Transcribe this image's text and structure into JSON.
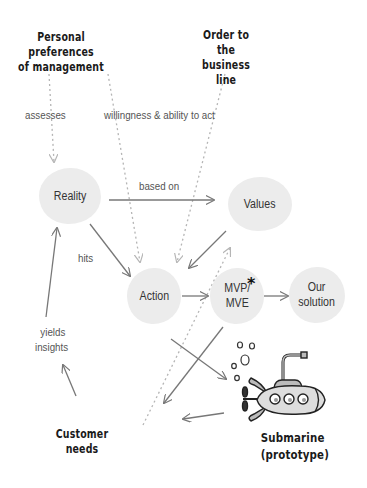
{
  "headings": {
    "top_left": [
      "Personal preferences",
      "of management"
    ],
    "top_right": [
      "Order to the",
      "business line"
    ],
    "bottom_left": "Customer needs",
    "bottom_right": [
      "Submarine",
      "(prototype)"
    ]
  },
  "nodes": {
    "reality": "Reality",
    "values": "Values",
    "action": "Action",
    "mvp": [
      "MVP/",
      "MVE"
    ],
    "mvp_marker": "*",
    "solution": [
      "Our",
      "solution"
    ]
  },
  "edge_labels": {
    "assesses": "assesses",
    "willingness": "willingness & ability to act",
    "based_on": "based on",
    "hits": "hits",
    "yields": [
      "yields",
      "insights"
    ]
  },
  "colors": {
    "blob": "#ececec",
    "arrow_solid": "#777777",
    "arrow_dotted": "#b5b5b5",
    "text_dark": "#1a1a1a",
    "label_text": "#555555"
  }
}
